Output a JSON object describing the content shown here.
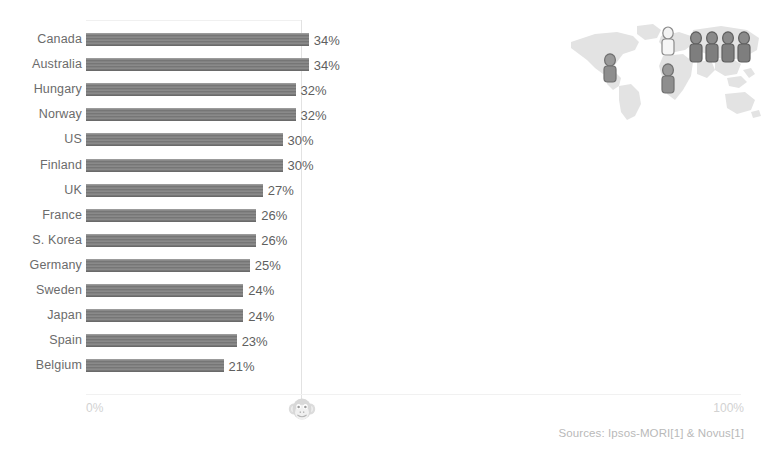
{
  "title_cropped": "",
  "axis": {
    "min_label": "0%",
    "max_label": "100%"
  },
  "sources": "Sources: Ipsos-MORI[1] & Novus[1]",
  "watermark": {
    "icon": "monkey-face-icon"
  },
  "map": {
    "icon": "world-map-icon",
    "figure_groups": [
      {
        "region": "north-america",
        "count": 1,
        "shade": "dark"
      },
      {
        "region": "europe",
        "count": 1,
        "shade": "light"
      },
      {
        "region": "africa",
        "count": 1,
        "shade": "dark"
      },
      {
        "region": "asia",
        "count": 4,
        "shade": "dark"
      }
    ]
  },
  "chart_data": {
    "type": "bar",
    "orientation": "horizontal",
    "title": "",
    "xlabel": "",
    "ylabel": "",
    "xlim": [
      0,
      100
    ],
    "grid": true,
    "gridlines": [
      50
    ],
    "legend": null,
    "value_suffix": "%",
    "categories": [
      "Canada",
      "Australia",
      "Hungary",
      "Norway",
      "US",
      "Finland",
      "UK",
      "France",
      "S. Korea",
      "Germany",
      "Sweden",
      "Japan",
      "Spain",
      "Belgium"
    ],
    "values": [
      34,
      34,
      32,
      32,
      30,
      30,
      27,
      26,
      26,
      25,
      24,
      24,
      23,
      21
    ],
    "value_labels": [
      "34%",
      "34%",
      "32%",
      "32%",
      "30%",
      "30%",
      "27%",
      "26%",
      "26%",
      "25%",
      "24%",
      "24%",
      "23%",
      "21%"
    ],
    "bar_color": "#7d7d7d",
    "label_color": "#6b6b6b",
    "axis_label_color": "#d2d2d2"
  }
}
